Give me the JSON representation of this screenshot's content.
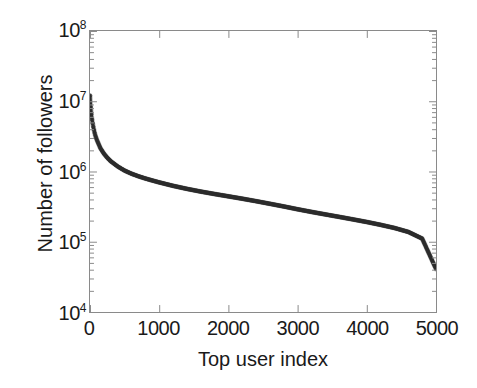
{
  "figure": {
    "background": "#ffffff",
    "axis_color": "#8a8a8a",
    "text_color": "#1a1a1a",
    "curve_color": "#2b2b2b"
  },
  "axis_titles": {
    "x": "Top user index",
    "y": "Number of followers"
  },
  "ticks": {
    "y": [
      {
        "label": "10",
        "exponent": "4",
        "value": 10000
      },
      {
        "label": "10",
        "exponent": "5",
        "value": 100000
      },
      {
        "label": "10",
        "exponent": "6",
        "value": 1000000
      },
      {
        "label": "10",
        "exponent": "7",
        "value": 10000000
      },
      {
        "label": "10",
        "exponent": "8",
        "value": 100000000
      }
    ],
    "x": [
      {
        "label": "0",
        "value": 0
      },
      {
        "label": "1000",
        "value": 1000
      },
      {
        "label": "2000",
        "value": 2000
      },
      {
        "label": "3000",
        "value": 3000
      },
      {
        "label": "4000",
        "value": 4000
      },
      {
        "label": "5000",
        "value": 5000
      }
    ]
  },
  "chart_data": {
    "type": "line",
    "title": "",
    "xlabel": "Top user index",
    "ylabel": "Number of followers",
    "xscale": "linear",
    "yscale": "log",
    "xlim": [
      0,
      5000
    ],
    "ylim": [
      10000,
      100000000
    ],
    "grid": false,
    "legend": null,
    "series": [
      {
        "name": "Number of followers",
        "color": "#2b2b2b",
        "marker": "dot-dense",
        "x": [
          1,
          5,
          10,
          20,
          30,
          50,
          75,
          100,
          150,
          200,
          250,
          300,
          400,
          500,
          600,
          700,
          800,
          900,
          1000,
          1200,
          1400,
          1600,
          1800,
          2000,
          2200,
          2400,
          2600,
          2800,
          3000,
          3200,
          3400,
          3600,
          3800,
          4000,
          4200,
          4400,
          4600,
          4800,
          5000
        ],
        "y": [
          12000000,
          9500000,
          8200000,
          6400000,
          5400000,
          4200000,
          3300000,
          2800000,
          2150000,
          1800000,
          1570000,
          1400000,
          1180000,
          1030000,
          930000,
          855000,
          795000,
          745000,
          700000,
          625000,
          566000,
          518000,
          478000,
          443000,
          410000,
          378000,
          347000,
          318000,
          290000,
          266000,
          245000,
          226000,
          208000,
          191000,
          174000,
          157000,
          138000,
          111000,
          41000
        ]
      }
    ]
  }
}
